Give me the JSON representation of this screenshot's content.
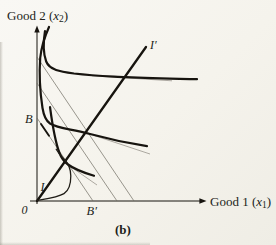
{
  "figure": {
    "caption_label": "(b)",
    "y_axis": {
      "prefix": "Good 2 (",
      "variable": "x",
      "subscript": "2",
      "suffix": ")"
    },
    "x_axis": {
      "prefix": "Good 1 (",
      "variable": "x",
      "subscript": "1",
      "suffix": ")"
    },
    "origin_label": "0",
    "point_labels": {
      "B": "B",
      "B_prime": "B′",
      "I": "I",
      "I_prime": "I′"
    },
    "colors": {
      "ink": "#17140f",
      "thin_line": "#6f6b62",
      "paper": "#f6f4ee"
    },
    "geometry": {
      "y_axis_line": "M 37 204 L 37 31",
      "x_axis_line": "M 30 201 L 201 201",
      "y_axis_arrow": "M 37 25.5 L 34.3 32.6 L 39.7 32.6 Z",
      "x_axis_arrow": "M 206.5 201 L 199.4 198.3 L 199.4 203.7 Z",
      "expansion_ray": "M 37 201 L 146 47",
      "budget_line_1": "M 37 118 L 93 201",
      "budget_line_2": "M 37 83 L 117 201",
      "budget_line_3": "M 37 57 L 134 201",
      "tangency_mark": "M 41 124 L 49 135.8",
      "ic_top": "M 45 31 C 43.2 42 43 53 46.2 61.5 C 49.5 70 60 71.5 74 73.5 C 96 76 112 76.3 126 77.2 C 150 78.5 174 78.8 197 79.2",
      "ic_middle": "M 49 27 C 45 36 41.5 46 40.2 58 C 39.2 72 40 92 42.5 108 C 43.8 116 45.5 120.5 50 123.5 C 58 128.5 72 129 88 133.5 C 102 137.3 130 143.5 147 146.2",
      "ic_bottom": "M 50 107 C 52 122 54.5 140 59.5 153 C 61.5 158.5 64 161.5 68 164.5 C 74.5 169.3 83 172.5 94 175.8",
      "hook_curve": "M 37 200.6 C 47 198.8 58 197.2 64 193.6 C 69.5 190.2 70.8 183.5 70.8 176 C 70.8 169 68.5 163.5 63.5 158.5 C 60.5 155.5 58 152.5 56.2 149.2",
      "tangent_top": "M 92 75.8 L 172 80.8",
      "tangent_middle": "M 95 135.8 L 150 154",
      "tangent_bottom": "M 64 162 L 97 185"
    }
  }
}
